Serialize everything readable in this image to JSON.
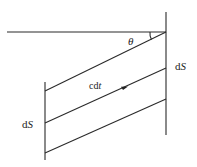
{
  "diagram": {
    "labels": {
      "theta": "θ",
      "cdt_c": "c",
      "cdt_d": "d",
      "cdt_t": "t",
      "ds_right_d": "d",
      "ds_right_s": "S",
      "ds_left_d": "d",
      "ds_left_s": "S"
    },
    "colors": {
      "line": "#2a2a2a",
      "background": "#ffffff"
    }
  }
}
